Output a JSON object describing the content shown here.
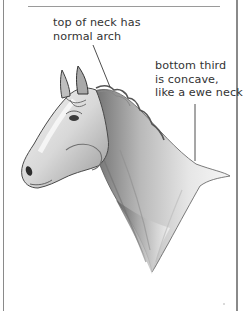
{
  "illustration": {
    "subject": "horse head and neck, side profile, pencil drawing",
    "frame_color": "#8a8a8a",
    "ink_color": "#333333"
  },
  "annotations": [
    {
      "id": "top-of-neck",
      "lines": [
        "top of neck has",
        "normal arch"
      ],
      "leader": {
        "x1": 93,
        "y1": 45,
        "x2": 110,
        "y2": 87
      }
    },
    {
      "id": "bottom-third",
      "lines": [
        "bottom third",
        "is concave,",
        "like a ewe neck"
      ],
      "leader": {
        "x1": 195,
        "y1": 104,
        "x2": 195,
        "y2": 161
      }
    }
  ]
}
